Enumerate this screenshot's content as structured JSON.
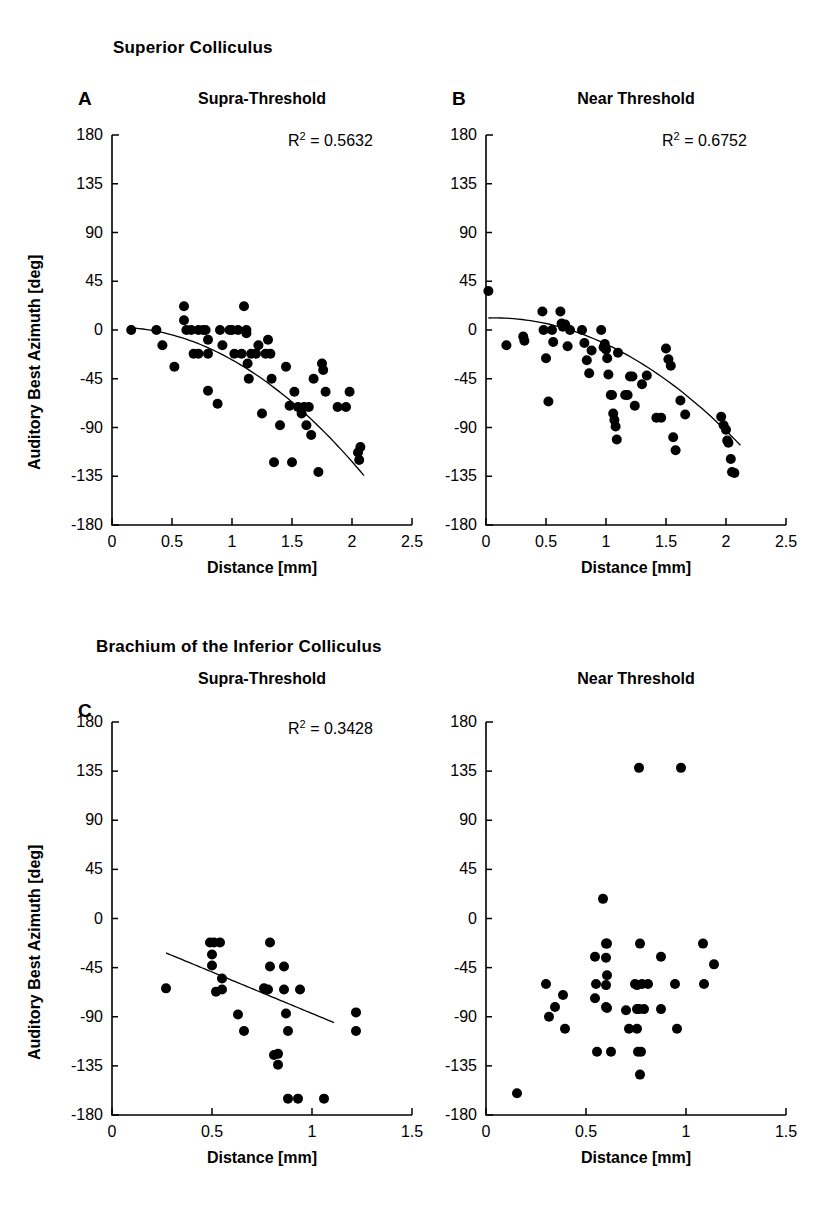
{
  "figure": {
    "sections": [
      {
        "id": "sc",
        "title": "Superior Colliculus"
      },
      {
        "id": "bic",
        "title": "Brachium of the Inferior Colliculus"
      }
    ],
    "axis_titles": {
      "x": "Distance [mm]",
      "y": "Auditory Best Azimuth [deg]"
    }
  },
  "panels": {
    "A": {
      "letter": "A",
      "title": "Supra-Threshold",
      "r2_prefix": "R",
      "r2_exp": "2",
      "r2_value": "= 0.5632"
    },
    "B": {
      "letter": "B",
      "title": "Near Threshold",
      "r2_prefix": "R",
      "r2_exp": "2",
      "r2_value": "= 0.6752"
    },
    "C": {
      "letter": "C",
      "title": "Supra-Threshold",
      "r2_prefix": "R",
      "r2_exp": "2",
      "r2_value": "= 0.3428"
    },
    "D": {
      "letter": "",
      "title": "Near Threshold",
      "r2_prefix": "",
      "r2_exp": "",
      "r2_value": ""
    }
  },
  "chart_data": [
    {
      "panel": "A",
      "type": "scatter",
      "title": "Supra-Threshold",
      "section": "Superior Colliculus",
      "xlabel": "Distance [mm]",
      "ylabel": "Auditory Best Azimuth [deg]",
      "xlim": [
        0,
        2.5
      ],
      "ylim": [
        -180,
        180
      ],
      "xticks": [
        0,
        0.5,
        1,
        1.5,
        2,
        2.5
      ],
      "xticklabels": [
        "0",
        "0.5",
        "1",
        "1.5",
        "2",
        "2.5"
      ],
      "yticks": [
        180,
        135,
        90,
        45,
        0,
        -45,
        -90,
        -135,
        -180
      ],
      "yticklabels": [
        "180",
        "135",
        "90",
        "45",
        "0",
        "-45",
        "-90",
        "-135",
        "-180"
      ],
      "grid": false,
      "legend": null,
      "annotations": [
        {
          "text": "R2 = 0.5632",
          "x": 1.55,
          "y": 150
        }
      ],
      "fit": {
        "kind": "quadratic",
        "label": "R^2 = 0.5632",
        "x_start": 0.16,
        "x_end": 2.1,
        "coefficients": {
          "a": -32.0,
          "b": 2.0,
          "c": 2.5
        }
      },
      "points": [
        {
          "x": 0.16,
          "y": 0
        },
        {
          "x": 0.37,
          "y": 0
        },
        {
          "x": 0.42,
          "y": -14
        },
        {
          "x": 0.52,
          "y": -34
        },
        {
          "x": 0.6,
          "y": 22
        },
        {
          "x": 0.6,
          "y": 9
        },
        {
          "x": 0.62,
          "y": 0
        },
        {
          "x": 0.66,
          "y": 0
        },
        {
          "x": 0.68,
          "y": -22
        },
        {
          "x": 0.72,
          "y": -22
        },
        {
          "x": 0.72,
          "y": 0
        },
        {
          "x": 0.76,
          "y": 0
        },
        {
          "x": 0.78,
          "y": 0
        },
        {
          "x": 0.8,
          "y": -22
        },
        {
          "x": 0.8,
          "y": -9
        },
        {
          "x": 0.8,
          "y": -56
        },
        {
          "x": 0.88,
          "y": -68
        },
        {
          "x": 0.9,
          "y": 0
        },
        {
          "x": 0.92,
          "y": -14
        },
        {
          "x": 0.98,
          "y": 0
        },
        {
          "x": 1.0,
          "y": 0
        },
        {
          "x": 1.02,
          "y": -22
        },
        {
          "x": 1.05,
          "y": 0
        },
        {
          "x": 1.08,
          "y": -22
        },
        {
          "x": 1.1,
          "y": 22
        },
        {
          "x": 1.12,
          "y": 0
        },
        {
          "x": 1.12,
          "y": -3
        },
        {
          "x": 1.13,
          "y": -31
        },
        {
          "x": 1.14,
          "y": -45
        },
        {
          "x": 1.16,
          "y": -22
        },
        {
          "x": 1.2,
          "y": -22
        },
        {
          "x": 1.22,
          "y": -14
        },
        {
          "x": 1.25,
          "y": -77
        },
        {
          "x": 1.28,
          "y": -22
        },
        {
          "x": 1.3,
          "y": -9
        },
        {
          "x": 1.32,
          "y": -22
        },
        {
          "x": 1.33,
          "y": -45
        },
        {
          "x": 1.35,
          "y": -122
        },
        {
          "x": 1.4,
          "y": -88
        },
        {
          "x": 1.45,
          "y": -34
        },
        {
          "x": 1.48,
          "y": -70
        },
        {
          "x": 1.5,
          "y": -122
        },
        {
          "x": 1.52,
          "y": -57
        },
        {
          "x": 1.55,
          "y": -71
        },
        {
          "x": 1.58,
          "y": -77
        },
        {
          "x": 1.6,
          "y": -71
        },
        {
          "x": 1.62,
          "y": -88
        },
        {
          "x": 1.64,
          "y": -71
        },
        {
          "x": 1.66,
          "y": -97
        },
        {
          "x": 1.68,
          "y": -45
        },
        {
          "x": 1.72,
          "y": -131
        },
        {
          "x": 1.75,
          "y": -31
        },
        {
          "x": 1.76,
          "y": -37
        },
        {
          "x": 1.78,
          "y": -57
        },
        {
          "x": 1.88,
          "y": -71
        },
        {
          "x": 1.95,
          "y": -71
        },
        {
          "x": 1.98,
          "y": -57
        },
        {
          "x": 2.05,
          "y": -113
        },
        {
          "x": 2.06,
          "y": -120
        },
        {
          "x": 2.07,
          "y": -108
        }
      ]
    },
    {
      "panel": "B",
      "type": "scatter",
      "title": "Near Threshold",
      "section": "Superior Colliculus",
      "xlabel": "Distance [mm]",
      "ylabel": "Auditory Best Azimuth [deg]",
      "xlim": [
        0,
        2.5
      ],
      "ylim": [
        -180,
        180
      ],
      "xticks": [
        0,
        0.5,
        1,
        1.5,
        2,
        2.5
      ],
      "xticklabels": [
        "0",
        "0.5",
        "1",
        "1.5",
        "2",
        "2.5"
      ],
      "yticks": [
        180,
        135,
        90,
        45,
        0,
        -45,
        -90,
        -135,
        -180
      ],
      "yticklabels": [
        "180",
        "135",
        "90",
        "45",
        "0",
        "-45",
        "-90",
        "-135",
        "-180"
      ],
      "grid": false,
      "legend": null,
      "annotations": [
        {
          "text": "R2 = 0.6752",
          "x": 1.55,
          "y": 150
        }
      ],
      "fit": {
        "kind": "quadratic",
        "label": "R^2 = 0.6752",
        "x_start": 0.02,
        "x_end": 2.12,
        "coefficients": {
          "a": -28.0,
          "b": 4.0,
          "c": 11.0
        }
      },
      "points": [
        {
          "x": 0.02,
          "y": 36
        },
        {
          "x": 0.17,
          "y": -14
        },
        {
          "x": 0.31,
          "y": -6
        },
        {
          "x": 0.32,
          "y": -10
        },
        {
          "x": 0.47,
          "y": 17
        },
        {
          "x": 0.48,
          "y": 0
        },
        {
          "x": 0.5,
          "y": -26
        },
        {
          "x": 0.52,
          "y": -66
        },
        {
          "x": 0.55,
          "y": 0
        },
        {
          "x": 0.56,
          "y": -11
        },
        {
          "x": 0.62,
          "y": 17
        },
        {
          "x": 0.63,
          "y": 6
        },
        {
          "x": 0.64,
          "y": 3
        },
        {
          "x": 0.66,
          "y": 5
        },
        {
          "x": 0.68,
          "y": -15
        },
        {
          "x": 0.7,
          "y": 0
        },
        {
          "x": 0.8,
          "y": 0
        },
        {
          "x": 0.82,
          "y": -12
        },
        {
          "x": 0.84,
          "y": -28
        },
        {
          "x": 0.86,
          "y": -40
        },
        {
          "x": 0.88,
          "y": -19
        },
        {
          "x": 0.96,
          "y": 0
        },
        {
          "x": 0.98,
          "y": -16
        },
        {
          "x": 0.99,
          "y": -13
        },
        {
          "x": 1.0,
          "y": -18
        },
        {
          "x": 1.01,
          "y": -26
        },
        {
          "x": 1.02,
          "y": -41
        },
        {
          "x": 1.04,
          "y": -60
        },
        {
          "x": 1.05,
          "y": -60
        },
        {
          "x": 1.06,
          "y": -77
        },
        {
          "x": 1.07,
          "y": -83
        },
        {
          "x": 1.08,
          "y": -89
        },
        {
          "x": 1.09,
          "y": -101
        },
        {
          "x": 1.1,
          "y": -21
        },
        {
          "x": 1.16,
          "y": -60
        },
        {
          "x": 1.18,
          "y": -60
        },
        {
          "x": 1.2,
          "y": -43
        },
        {
          "x": 1.22,
          "y": -43
        },
        {
          "x": 1.24,
          "y": -70
        },
        {
          "x": 1.3,
          "y": -50
        },
        {
          "x": 1.34,
          "y": -42
        },
        {
          "x": 1.42,
          "y": -81
        },
        {
          "x": 1.46,
          "y": -81
        },
        {
          "x": 1.5,
          "y": -17
        },
        {
          "x": 1.52,
          "y": -27
        },
        {
          "x": 1.54,
          "y": -33
        },
        {
          "x": 1.56,
          "y": -99
        },
        {
          "x": 1.58,
          "y": -111
        },
        {
          "x": 1.62,
          "y": -65
        },
        {
          "x": 1.66,
          "y": -78
        },
        {
          "x": 1.96,
          "y": -80
        },
        {
          "x": 1.98,
          "y": -88
        },
        {
          "x": 2.0,
          "y": -92
        },
        {
          "x": 2.01,
          "y": -102
        },
        {
          "x": 2.02,
          "y": -104
        },
        {
          "x": 2.04,
          "y": -119
        },
        {
          "x": 2.05,
          "y": -131
        },
        {
          "x": 2.07,
          "y": -132
        }
      ]
    },
    {
      "panel": "C",
      "type": "scatter",
      "title": "Supra-Threshold",
      "section": "Brachium of the Inferior Colliculus",
      "xlabel": "Distance [mm]",
      "ylabel": "Auditory Best Azimuth [deg]",
      "xlim": [
        0,
        1.5
      ],
      "ylim": [
        -180,
        180
      ],
      "xticks": [
        0,
        0.5,
        1,
        1.5
      ],
      "xticklabels": [
        "0",
        "0.5",
        "1",
        "1.5"
      ],
      "yticks": [
        180,
        135,
        90,
        45,
        0,
        -45,
        -90,
        -135,
        -180
      ],
      "yticklabels": [
        "180",
        "135",
        "90",
        "45",
        "0",
        "-45",
        "-90",
        "-135",
        "-180"
      ],
      "grid": false,
      "legend": null,
      "annotations": [
        {
          "text": "R2 = 0.3428",
          "x": 0.93,
          "y": 150
        }
      ],
      "fit": {
        "kind": "linear",
        "label": "R^2 = 0.3428",
        "x_start": 0.27,
        "x_end": 1.11,
        "slope": -76.0,
        "intercept": -11.0
      },
      "points": [
        {
          "x": 0.27,
          "y": -64
        },
        {
          "x": 0.49,
          "y": -22
        },
        {
          "x": 0.51,
          "y": -22
        },
        {
          "x": 0.5,
          "y": -33
        },
        {
          "x": 0.5,
          "y": -43
        },
        {
          "x": 0.52,
          "y": -67
        },
        {
          "x": 0.54,
          "y": -22
        },
        {
          "x": 0.55,
          "y": -55
        },
        {
          "x": 0.55,
          "y": -65
        },
        {
          "x": 0.63,
          "y": -88
        },
        {
          "x": 0.66,
          "y": -103
        },
        {
          "x": 0.76,
          "y": -64
        },
        {
          "x": 0.79,
          "y": -22
        },
        {
          "x": 0.79,
          "y": -44
        },
        {
          "x": 0.78,
          "y": -65
        },
        {
          "x": 0.81,
          "y": -125
        },
        {
          "x": 0.83,
          "y": -134
        },
        {
          "x": 0.83,
          "y": -124
        },
        {
          "x": 0.86,
          "y": -44
        },
        {
          "x": 0.86,
          "y": -65
        },
        {
          "x": 0.87,
          "y": -87
        },
        {
          "x": 0.88,
          "y": -103
        },
        {
          "x": 0.88,
          "y": -165
        },
        {
          "x": 0.93,
          "y": -165
        },
        {
          "x": 0.94,
          "y": -65
        },
        {
          "x": 1.06,
          "y": -165
        },
        {
          "x": 1.22,
          "y": -86
        },
        {
          "x": 1.22,
          "y": -103
        }
      ]
    },
    {
      "panel": "D",
      "type": "scatter",
      "title": "Near Threshold",
      "section": "Brachium of the Inferior Colliculus",
      "xlabel": "Distance [mm]",
      "ylabel": "Auditory Best Azimuth [deg]",
      "xlim": [
        0,
        1.5
      ],
      "ylim": [
        -180,
        180
      ],
      "xticks": [
        0,
        0.5,
        1,
        1.5
      ],
      "xticklabels": [
        "0",
        "0.5",
        "1",
        "1.5"
      ],
      "yticks": [
        180,
        135,
        90,
        45,
        0,
        -45,
        -90,
        -135,
        -180
      ],
      "yticklabels": [
        "180",
        "135",
        "90",
        "45",
        "0",
        "-45",
        "-90",
        "-135",
        "-180"
      ],
      "grid": false,
      "legend": null,
      "annotations": [],
      "fit": null,
      "points": [
        {
          "x": 0.155,
          "y": -160
        },
        {
          "x": 0.3,
          "y": -60
        },
        {
          "x": 0.315,
          "y": -90
        },
        {
          "x": 0.345,
          "y": -81
        },
        {
          "x": 0.385,
          "y": -70
        },
        {
          "x": 0.395,
          "y": -101
        },
        {
          "x": 0.545,
          "y": -35
        },
        {
          "x": 0.55,
          "y": -60
        },
        {
          "x": 0.545,
          "y": -73
        },
        {
          "x": 0.555,
          "y": -122
        },
        {
          "x": 0.585,
          "y": 18
        },
        {
          "x": 0.6,
          "y": -23
        },
        {
          "x": 0.605,
          "y": -23
        },
        {
          "x": 0.6,
          "y": -36
        },
        {
          "x": 0.605,
          "y": -52
        },
        {
          "x": 0.6,
          "y": -61
        },
        {
          "x": 0.6,
          "y": -81
        },
        {
          "x": 0.605,
          "y": -82
        },
        {
          "x": 0.625,
          "y": -122
        },
        {
          "x": 0.7,
          "y": -84
        },
        {
          "x": 0.715,
          "y": -101
        },
        {
          "x": 0.745,
          "y": -60
        },
        {
          "x": 0.755,
          "y": -61
        },
        {
          "x": 0.755,
          "y": -83
        },
        {
          "x": 0.765,
          "y": -83
        },
        {
          "x": 0.755,
          "y": -101
        },
        {
          "x": 0.76,
          "y": -122
        },
        {
          "x": 0.775,
          "y": -122
        },
        {
          "x": 0.77,
          "y": -143
        },
        {
          "x": 0.765,
          "y": 138
        },
        {
          "x": 0.77,
          "y": -23
        },
        {
          "x": 0.78,
          "y": -60
        },
        {
          "x": 0.79,
          "y": -83
        },
        {
          "x": 0.81,
          "y": -60
        },
        {
          "x": 0.875,
          "y": -35
        },
        {
          "x": 0.875,
          "y": -83
        },
        {
          "x": 0.945,
          "y": -60
        },
        {
          "x": 0.955,
          "y": -101
        },
        {
          "x": 0.975,
          "y": 138
        },
        {
          "x": 1.085,
          "y": -23
        },
        {
          "x": 1.09,
          "y": -60
        },
        {
          "x": 1.14,
          "y": -42
        }
      ]
    }
  ]
}
